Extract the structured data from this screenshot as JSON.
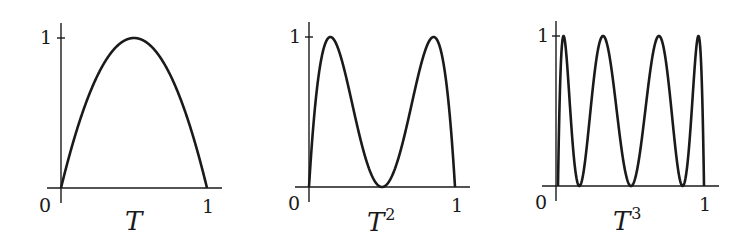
{
  "figure": {
    "panels": [
      {
        "title": "T",
        "exponent": "",
        "y_tick": "1",
        "x_origin": "0",
        "x_tick": "1"
      },
      {
        "title": "T",
        "exponent": "2",
        "y_tick": "1",
        "x_origin": "0",
        "x_tick": "1"
      },
      {
        "title": "T",
        "exponent": "3",
        "y_tick": "1",
        "x_origin": "0",
        "x_tick": "1"
      }
    ],
    "stroke_color": "#1a1a1a"
  },
  "chart_data": [
    {
      "type": "line",
      "title": "T",
      "function": "T(x) = 4x(1-x)",
      "iterations": 1,
      "x": [
        0,
        0.125,
        0.25,
        0.375,
        0.5,
        0.625,
        0.75,
        0.875,
        1
      ],
      "values": [
        0,
        0.4375,
        0.75,
        0.9375,
        1,
        0.9375,
        0.75,
        0.4375,
        0
      ],
      "peaks_at": [
        0.5
      ],
      "zeros_at": [
        0,
        1
      ],
      "xlabel": "T",
      "ylabel": "",
      "x_ticks": [
        "0",
        "1"
      ],
      "y_ticks": [
        "1"
      ],
      "xlim": [
        0,
        1
      ],
      "ylim": [
        0,
        1
      ],
      "grid": false
    },
    {
      "type": "line",
      "title": "T^2",
      "function": "T(T(x))",
      "iterations": 2,
      "x": [
        0,
        0.1464,
        0.25,
        0.5,
        0.75,
        0.8536,
        1
      ],
      "values": [
        0,
        1,
        0.75,
        0,
        0.75,
        1,
        0
      ],
      "peaks_at": [
        0.1464,
        0.8536
      ],
      "zeros_at": [
        0,
        0.5,
        1
      ],
      "xlabel": "T^2",
      "ylabel": "",
      "x_ticks": [
        "0",
        "1"
      ],
      "y_ticks": [
        "1"
      ],
      "xlim": [
        0,
        1
      ],
      "ylim": [
        0,
        1
      ],
      "grid": false
    },
    {
      "type": "line",
      "title": "T^3",
      "function": "T(T(T(x)))",
      "iterations": 3,
      "x": [
        0,
        0.038,
        0.1464,
        0.3087,
        0.5,
        0.6913,
        0.8536,
        0.962,
        1
      ],
      "values": [
        0,
        1,
        0,
        1,
        0,
        1,
        0,
        1,
        0
      ],
      "peaks_at": [
        0.038,
        0.3087,
        0.6913,
        0.962
      ],
      "zeros_at": [
        0,
        0.1464,
        0.5,
        0.8536,
        1
      ],
      "xlabel": "T^3",
      "ylabel": "",
      "x_ticks": [
        "0",
        "1"
      ],
      "y_ticks": [
        "1"
      ],
      "xlim": [
        0,
        1
      ],
      "ylim": [
        0,
        1
      ],
      "grid": false
    }
  ]
}
